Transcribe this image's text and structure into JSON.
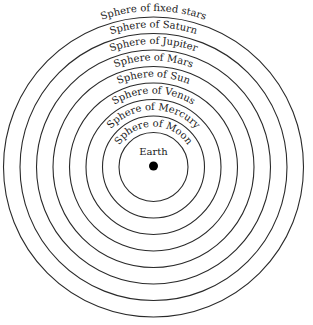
{
  "diagram": {
    "center": {
      "label": "Earth",
      "color": "#000000"
    },
    "spheres": [
      {
        "label": "Sphere of fixed stars",
        "radius": 150
      },
      {
        "label": "Sphere of Saturn",
        "radius": 133.5
      },
      {
        "label": "Sphere of Jupiter",
        "radius": 117
      },
      {
        "label": "Sphere of Mars",
        "radius": 100.5
      },
      {
        "label": "Sphere of Sun",
        "radius": 84
      },
      {
        "label": "Sphere of Venus",
        "radius": 67.5
      },
      {
        "label": "Sphere of Mercury",
        "radius": 51
      },
      {
        "label": "Sphere of Moon",
        "radius": 34.5
      }
    ],
    "line_color": "#2a2a2a",
    "text_color": "#1a1a1a"
  }
}
